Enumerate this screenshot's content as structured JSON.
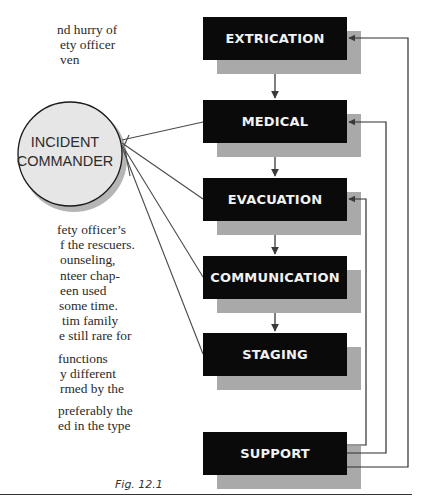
{
  "page": {
    "text_fragments_top": [
      "nd hurry of",
      "ety officer",
      "ven"
    ],
    "text_fragments_middle": [
      "fety officer’s",
      "f the rescuers.",
      "ounseling,",
      "nteer chap-",
      "een used",
      "some time.",
      "tim family",
      "e still rare for",
      "",
      "functions",
      "y different",
      "rmed by the",
      "",
      "preferably the",
      "ed in the type"
    ]
  },
  "figure": {
    "caption": "Fig. 12.1",
    "commander": {
      "line1": "INCIDENT",
      "line2": "COMMANDER"
    },
    "boxes": [
      {
        "label": "EXTRICATION"
      },
      {
        "label": "MEDICAL"
      },
      {
        "label": "EVACUATION"
      },
      {
        "label": "COMMUNICATION"
      },
      {
        "label": "STAGING"
      },
      {
        "label": "SUPPORT"
      }
    ],
    "colors": {
      "box_fill": "#0a0a0a",
      "box_text": "#f2f2f2",
      "box_shadow": "#a9a9a9",
      "circle_fill": "#e6e6e6",
      "circle_shadow": "#b5b5b5",
      "line": "#3a3a3a"
    }
  }
}
